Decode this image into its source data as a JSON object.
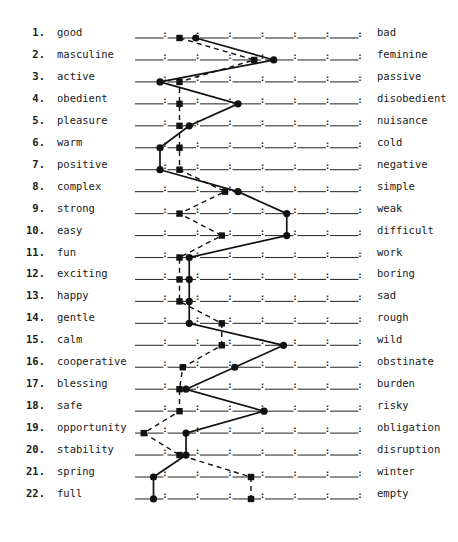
{
  "chart_data": {
    "type": "line",
    "title": "",
    "subtitle": "",
    "xlabel": "",
    "ylabel": "",
    "scale_points": 7,
    "xlim": [
      1,
      7
    ],
    "grid": false,
    "legend": null,
    "scales": [
      {
        "n": "1.",
        "left": "good",
        "right": "bad"
      },
      {
        "n": "2.",
        "left": "masculine",
        "right": "feminine"
      },
      {
        "n": "3.",
        "left": "active",
        "right": "passive"
      },
      {
        "n": "4.",
        "left": "obedient",
        "right": "disobedient"
      },
      {
        "n": "5.",
        "left": "pleasure",
        "right": "nuisance"
      },
      {
        "n": "6.",
        "left": "warm",
        "right": "cold"
      },
      {
        "n": "7.",
        "left": "positive",
        "right": "negative"
      },
      {
        "n": "8.",
        "left": "complex",
        "right": "simple"
      },
      {
        "n": "9.",
        "left": "strong",
        "right": "weak"
      },
      {
        "n": "10.",
        "left": "easy",
        "right": "difficult"
      },
      {
        "n": "11.",
        "left": "fun",
        "right": "work"
      },
      {
        "n": "12.",
        "left": "exciting",
        "right": "boring"
      },
      {
        "n": "13.",
        "left": "happy",
        "right": "sad"
      },
      {
        "n": "14.",
        "left": "gentle",
        "right": "rough"
      },
      {
        "n": "15.",
        "left": "calm",
        "right": "wild"
      },
      {
        "n": "16.",
        "left": "cooperative",
        "right": "obstinate"
      },
      {
        "n": "17.",
        "left": "blessing",
        "right": "burden"
      },
      {
        "n": "18.",
        "left": "safe",
        "right": "risky"
      },
      {
        "n": "19.",
        "left": "opportunity",
        "right": "obligation"
      },
      {
        "n": "20.",
        "left": "stability",
        "right": "disruption"
      },
      {
        "n": "21.",
        "left": "spring",
        "right": "winter"
      },
      {
        "n": "22.",
        "left": "full",
        "right": "empty"
      }
    ],
    "series": [
      {
        "name": "solid-circles",
        "style": "solid",
        "marker": "circle",
        "values": [
          2.4,
          4.8,
          1.3,
          3.7,
          2.2,
          1.3,
          1.3,
          3.7,
          5.2,
          5.2,
          2.2,
          2.2,
          2.2,
          2.2,
          5.1,
          3.6,
          2.1,
          4.5,
          2.1,
          2.1,
          1.1,
          1.1
        ]
      },
      {
        "name": "dashed-squares",
        "style": "dashed",
        "marker": "square",
        "values": [
          1.9,
          4.2,
          1.9,
          1.9,
          1.9,
          1.9,
          1.9,
          3.3,
          1.9,
          3.2,
          1.9,
          1.9,
          1.9,
          3.2,
          3.2,
          2.0,
          1.9,
          1.9,
          0.8,
          1.9,
          4.1,
          4.1
        ]
      }
    ]
  },
  "layout": {
    "line_x_start": 134,
    "segment_width": 32.5,
    "row_y_start": 38,
    "row_spacing": 21.95
  }
}
